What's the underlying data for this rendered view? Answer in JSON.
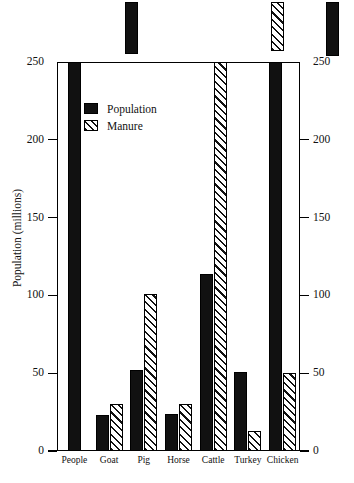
{
  "chart_data": {
    "type": "bar",
    "title": "",
    "xlabel": "",
    "ylabel": "Population (millions)",
    "ylabel_right": "Quantity of manure/year (million tons)",
    "categories": [
      "People",
      "Goat",
      "Pig",
      "Horse",
      "Cattle",
      "Turkey",
      "Chicken"
    ],
    "series": [
      {
        "name": "Population",
        "axis": "left",
        "unit": "millions",
        "style": "solid-black",
        "values": [
          270,
          23,
          52,
          24,
          114,
          51,
          275
        ],
        "clipped": [
          true,
          false,
          false,
          false,
          false,
          false,
          true
        ]
      },
      {
        "name": "Manure",
        "axis": "right",
        "unit": "million tons",
        "style": "diagonal-hatch",
        "values": [
          null,
          30,
          101,
          30,
          265,
          13,
          50
        ],
        "clipped": [
          false,
          false,
          false,
          false,
          true,
          false,
          false
        ]
      }
    ],
    "ylim": [
      0,
      250
    ],
    "ylim_right": [
      0,
      250
    ],
    "yticks": [
      0,
      50,
      100,
      150,
      200,
      250
    ],
    "yticks_right": [
      0,
      50,
      100,
      150,
      200,
      250
    ],
    "ytick_labels": [
      "0",
      "50",
      "100",
      "150",
      "200",
      "250"
    ],
    "ytick_labels_right": [
      "0",
      "50",
      "100",
      "150",
      "200",
      "250"
    ],
    "grid": false,
    "legend_position": "upper-left-inside",
    "colors": {
      "bar_fill": "#111111",
      "axis": "#000000",
      "background": "#ffffff"
    }
  },
  "legend": {
    "items": [
      {
        "label": "Population",
        "swatch": "solid-black"
      },
      {
        "label": "Manure",
        "swatch": "diagonal-hatch"
      }
    ]
  }
}
